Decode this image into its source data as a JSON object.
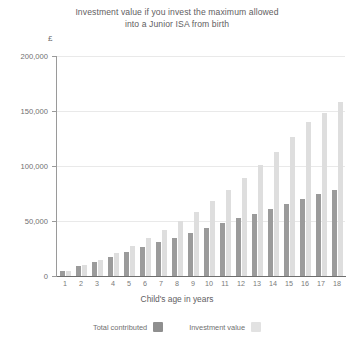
{
  "chart": {
    "title": "Investment value if you invest the maximum allowed into a Junior ISA from birth",
    "title_line1": "Investment value if you invest the maximum allowed",
    "title_line2": "into a Junior ISA from birth",
    "y_unit": "£",
    "xaxis_title": "Child's age in years",
    "legend": [
      {
        "label": "Total contributed",
        "color": "#8f8f8f"
      },
      {
        "label": "Investment value",
        "color": "#e2e2e2"
      }
    ]
  },
  "chart_data": {
    "type": "bar",
    "title": "Investment value if you invest the maximum allowed into a Junior ISA from birth",
    "xlabel": "Child's age in years",
    "ylabel": "£",
    "ylim": [
      0,
      200000
    ],
    "yticks": [
      0,
      50000,
      100000,
      150000,
      200000
    ],
    "ytick_labels": [
      "0",
      "50,000",
      "100,000",
      "150,000",
      "200,000"
    ],
    "grid": true,
    "legend_position": "bottom",
    "categories": [
      "1",
      "2",
      "3",
      "4",
      "5",
      "6",
      "7",
      "8",
      "9",
      "10",
      "11",
      "12",
      "13",
      "14",
      "15",
      "16",
      "17",
      "18"
    ],
    "series": [
      {
        "name": "Total contributed",
        "color": "#9b9b9b",
        "values": [
          4368,
          8736,
          13104,
          17472,
          21840,
          26208,
          30576,
          34944,
          39312,
          43680,
          48048,
          52416,
          56784,
          61152,
          65520,
          69888,
          74256,
          78624
        ]
      },
      {
        "name": "Investment value",
        "color": "#dedede",
        "values": [
          4600,
          9600,
          15000,
          21000,
          27500,
          34500,
          42000,
          50000,
          58500,
          68000,
          78000,
          89000,
          101000,
          113000,
          126000,
          140000,
          148000,
          158000
        ]
      }
    ]
  }
}
